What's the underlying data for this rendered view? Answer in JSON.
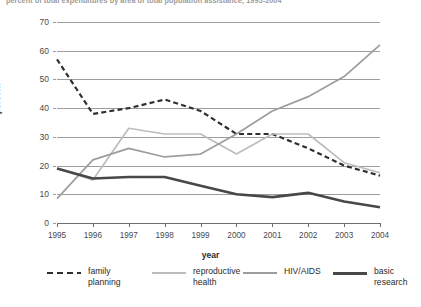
{
  "title": {
    "text": "percent of total expenditures by area of total population assistance, 1995-2004",
    "clipped": true
  },
  "axes": {
    "y": {
      "label": "percent",
      "ticks": [
        0,
        10,
        20,
        30,
        40,
        50,
        60,
        70
      ],
      "min": 0,
      "max": 70
    },
    "x": {
      "label": "year",
      "ticks": [
        "1995",
        "1996",
        "1997",
        "1998",
        "1999",
        "2000",
        "2001",
        "2002",
        "2003",
        "2004"
      ]
    }
  },
  "legend": [
    {
      "label": "family\nplanning",
      "style": "dashed",
      "color": "#2f2f2f",
      "width": 2.2
    },
    {
      "label": "reproductive\nhealth",
      "style": "solid",
      "color": "#bdbdbd",
      "width": 1.7
    },
    {
      "label": "HIV/AIDS",
      "style": "solid",
      "color": "#9d9d9d",
      "width": 1.7
    },
    {
      "label": "basic\nresearch",
      "style": "solid",
      "color": "#484848",
      "width": 2.6
    }
  ],
  "colors": {
    "family_planning": "#2f2f2f",
    "reproductive_health": "#bdbdbd",
    "hiv_aids": "#9d9d9d",
    "basic_research": "#484848",
    "gridline": "#9d9d9d",
    "axis": "#6f6f6f",
    "text": "#3a3a3a"
  },
  "chart_data": {
    "type": "line",
    "title": "percent of total expenditures by area of total population assistance, 1995-2004",
    "xlabel": "year",
    "ylabel": "percent",
    "ylim": [
      0,
      70
    ],
    "grid": true,
    "legend_position": "bottom",
    "categories": [
      "1995",
      "1996",
      "1997",
      "1998",
      "1999",
      "2000",
      "2001",
      "2002",
      "2003",
      "2004"
    ],
    "series": [
      {
        "name": "family planning",
        "style": "dashed",
        "values": [
          57,
          38,
          40,
          43,
          39,
          31,
          31,
          26,
          20,
          16.5
        ]
      },
      {
        "name": "reproductive health",
        "style": "solid",
        "values": [
          19,
          15,
          33,
          31,
          31,
          24,
          31,
          31,
          21,
          17.5
        ]
      },
      {
        "name": "HIV/AIDS",
        "style": "solid",
        "values": [
          8.5,
          22,
          26,
          23,
          24,
          31,
          39,
          44,
          51,
          62
        ]
      },
      {
        "name": "basic research",
        "style": "solid",
        "values": [
          19,
          15.5,
          16,
          16,
          13,
          10,
          9,
          10.5,
          7.5,
          5.5
        ]
      }
    ]
  }
}
